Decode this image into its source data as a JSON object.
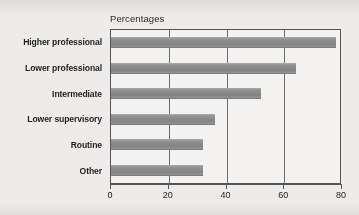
{
  "chart_data": {
    "type": "bar",
    "orientation": "horizontal",
    "title": "",
    "axis_title": "Percentages",
    "xlabel": "",
    "ylabel": "",
    "categories": [
      "Higher professional",
      "Lower professional",
      "Intermediate",
      "Lower supervisory",
      "Routine",
      "Other"
    ],
    "values": [
      78,
      64,
      52,
      36,
      32,
      32
    ],
    "xlim": [
      0,
      80
    ],
    "xticks": [
      0,
      20,
      40,
      60,
      80
    ],
    "xtick_labels": [
      "0",
      "20",
      "40",
      "60",
      "80"
    ],
    "grid": true,
    "grid_axis": "x",
    "legend": false,
    "series": [
      {
        "name": "Percentages",
        "values": [
          78,
          64,
          52,
          36,
          32,
          32
        ]
      }
    ]
  },
  "style": {
    "bar_color": "#8b8b8b",
    "plot_background": "#f4f2f0",
    "page_background": "#eeecea",
    "axis_color": "#555555",
    "grid_color": "#6b6b6b",
    "text_color": "#1f1f1f"
  }
}
